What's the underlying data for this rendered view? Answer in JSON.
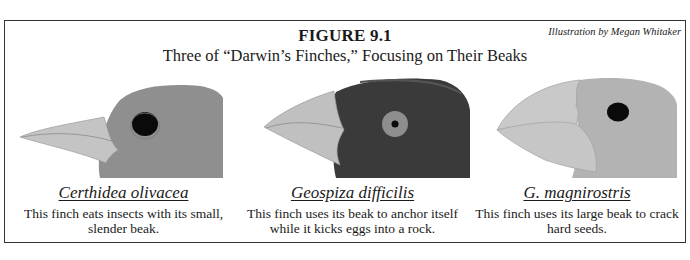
{
  "figure": {
    "label": "FIGURE 9.1",
    "subtitle": "Three of “Darwin’s Finches,” Focusing on Their Beaks",
    "credit": "Illustration by Megan Whitaker"
  },
  "finches": [
    {
      "species": "Certhidea olivacea",
      "description": "This finch eats insects with its small, slender beak.",
      "head_color": "#8f8f8f",
      "beak_color": "#c4c4c4",
      "eye_color": "#0a0a0a"
    },
    {
      "species": "Geospiza difficilis",
      "description": "This finch uses its beak to anchor itself while it kicks eggs into a rock.",
      "head_color": "#3a3a3a",
      "beak_color": "#c0c0c0",
      "eye_color": "#8e8e8e"
    },
    {
      "species": "G. magnirostris",
      "description": "This finch uses its large beak to crack hard seeds.",
      "head_color": "#b3b3b3",
      "beak_color": "#c9c9c9",
      "eye_color": "#0a0a0a"
    }
  ],
  "colors": {
    "border": "#333333",
    "text": "#1a1a1a",
    "background": "#ffffff"
  }
}
